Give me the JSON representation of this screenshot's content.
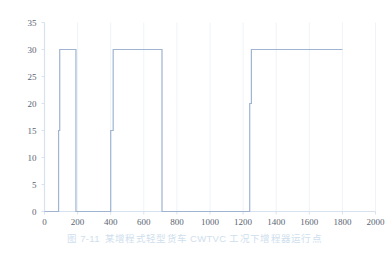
{
  "caption": {
    "number": "图 7-11",
    "text": "某增程式轻型货车 CWTVC 工况下增程器运行点"
  },
  "colors": {
    "line": "#9fb4d0",
    "axis": "#d8e2ee",
    "grid": "#eef3f9",
    "tick_label": "#5a6472",
    "caption": "#cfe0ee",
    "background": "#ffffff"
  },
  "chart_data": {
    "type": "line",
    "title": "",
    "xlabel": "",
    "ylabel": "",
    "xlim": [
      0,
      2000
    ],
    "ylim": [
      0,
      35
    ],
    "xticks": [
      0,
      200,
      400,
      600,
      800,
      1000,
      1200,
      1400,
      1600,
      1800,
      2000
    ],
    "xtick_labels": [
      "0",
      "200",
      "400",
      "600",
      "800",
      "1000",
      "1200",
      "1400",
      "1600",
      "1800",
      "2000"
    ],
    "yticks": [
      0,
      5,
      10,
      15,
      20,
      25,
      30,
      35
    ],
    "ytick_labels": [
      "0",
      "5",
      "10",
      "15",
      "20",
      "25",
      "30",
      "35"
    ],
    "grid": "faint-vertical",
    "legend": "none",
    "drawstyle": "steps-post",
    "series": [
      {
        "name": "增程器运行点",
        "color": "#9fb4d0",
        "x": [
          0,
          85,
          85,
          92,
          92,
          190,
          190,
          400,
          400,
          415,
          415,
          710,
          710,
          1240,
          1240,
          1250,
          1250,
          1800
        ],
        "y": [
          0,
          0,
          15,
          15,
          30,
          30,
          0,
          0,
          15,
          15,
          30,
          30,
          0,
          0,
          20,
          20,
          30,
          30
        ]
      }
    ]
  }
}
